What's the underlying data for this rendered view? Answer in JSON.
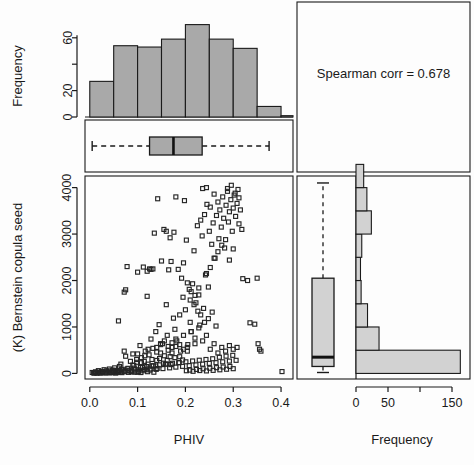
{
  "figure": {
    "annotation": "Spearman corr =  0.678",
    "xlabel_left": "PHIV",
    "xlabel_right": "Frequency",
    "ylabel_left": "(K) Bernstein copula seed",
    "ylabel_top": "Frequency",
    "colors": {
      "top_hist_fill": "#a9a9a9",
      "right_hist_fill": "#d2d2d2",
      "box_fill_top": "#a9a9a9",
      "box_fill_right": "#d2d2d2",
      "stroke": "#1a1a1a",
      "background": "#fdfdfd"
    }
  },
  "chart_data": [
    {
      "type": "bar",
      "name": "top-marginal-histogram",
      "title": "",
      "xlabel": "",
      "ylabel": "Frequency",
      "orientation": "vertical",
      "xlim": [
        -0.01,
        0.425
      ],
      "ylim": [
        0,
        75
      ],
      "ytick_values": [
        0,
        20,
        60
      ],
      "ytick_labels": [
        "0",
        "20",
        "60"
      ],
      "yminor_values": [
        40
      ],
      "bin_edges": [
        0.0,
        0.05,
        0.1,
        0.15,
        0.2,
        0.25,
        0.3,
        0.35,
        0.4
      ],
      "bin_width": 0.05,
      "categories": [
        "0.00-0.05",
        "0.05-0.10",
        "0.10-0.15",
        "0.15-0.20",
        "0.20-0.25",
        "0.25-0.30",
        "0.30-0.35",
        "0.35-0.40"
      ],
      "values": [
        27,
        54,
        53,
        59,
        70,
        59,
        52,
        8
      ],
      "extra_tail_value": 1,
      "grid": false,
      "legend": null
    },
    {
      "type": "boxplot",
      "name": "top-marginal-boxplot",
      "orientation": "horizontal",
      "variable": "PHIV",
      "xlim": [
        -0.01,
        0.425
      ],
      "whisker_low": 0.005,
      "q1": 0.125,
      "median": 0.175,
      "q3": 0.235,
      "whisker_high": 0.375,
      "outliers": []
    },
    {
      "type": "scatter",
      "name": "main-scatter",
      "title": "",
      "xlabel": "PHIV",
      "ylabel": "(K) Bernstein copula seed",
      "xlim": [
        -0.01,
        0.425
      ],
      "ylim": [
        -120,
        4250
      ],
      "xtick_values": [
        0.0,
        0.1,
        0.2,
        0.3,
        0.4
      ],
      "xtick_labels": [
        "0.0",
        "0.1",
        "0.2",
        "0.3",
        "0.4"
      ],
      "ytick_values": [
        0,
        1000,
        2000,
        3000,
        4000
      ],
      "ytick_labels": [
        "0",
        "1000",
        "2000",
        "3000",
        "4000"
      ],
      "marker": "open-square",
      "marker_size": 4,
      "spearman_corr": 0.678,
      "n_points": 383,
      "grid": false,
      "points": [
        [
          0.005,
          20
        ],
        [
          0.008,
          10
        ],
        [
          0.012,
          35
        ],
        [
          0.015,
          5
        ],
        [
          0.018,
          60
        ],
        [
          0.021,
          15
        ],
        [
          0.024,
          45
        ],
        [
          0.027,
          25
        ],
        [
          0.03,
          80
        ],
        [
          0.032,
          10
        ],
        [
          0.035,
          55
        ],
        [
          0.038,
          30
        ],
        [
          0.041,
          95
        ],
        [
          0.044,
          20
        ],
        [
          0.047,
          70
        ],
        [
          0.05,
          40
        ],
        [
          0.052,
          120
        ],
        [
          0.055,
          15
        ],
        [
          0.058,
          65
        ],
        [
          0.06,
          35
        ],
        [
          0.062,
          150
        ],
        [
          0.065,
          25
        ],
        [
          0.068,
          90
        ],
        [
          0.07,
          50
        ],
        [
          0.072,
          1750
        ],
        [
          0.075,
          1800
        ],
        [
          0.078,
          2300
        ],
        [
          0.06,
          1130
        ],
        [
          0.065,
          200
        ],
        [
          0.072,
          480
        ],
        [
          0.075,
          370
        ],
        [
          0.08,
          110
        ],
        [
          0.082,
          60
        ],
        [
          0.085,
          260
        ],
        [
          0.088,
          30
        ],
        [
          0.09,
          420
        ],
        [
          0.092,
          170
        ],
        [
          0.095,
          75
        ],
        [
          0.098,
          300
        ],
        [
          0.1,
          2180
        ],
        [
          0.102,
          45
        ],
        [
          0.105,
          600
        ],
        [
          0.108,
          230
        ],
        [
          0.11,
          130
        ],
        [
          0.112,
          2290
        ],
        [
          0.115,
          380
        ],
        [
          0.118,
          90
        ],
        [
          0.12,
          1660
        ],
        [
          0.122,
          520
        ],
        [
          0.125,
          2250
        ],
        [
          0.128,
          740
        ],
        [
          0.13,
          160
        ],
        [
          0.132,
          2250
        ],
        [
          0.135,
          3020
        ],
        [
          0.138,
          900
        ],
        [
          0.14,
          280
        ],
        [
          0.142,
          3760
        ],
        [
          0.145,
          1050
        ],
        [
          0.148,
          440
        ],
        [
          0.15,
          2420
        ],
        [
          0.152,
          640
        ],
        [
          0.155,
          3100
        ],
        [
          0.158,
          200
        ],
        [
          0.16,
          1480
        ],
        [
          0.162,
          820
        ],
        [
          0.165,
          2230
        ],
        [
          0.168,
          360
        ],
        [
          0.17,
          2410
        ],
        [
          0.172,
          560
        ],
        [
          0.175,
          1190
        ],
        [
          0.178,
          950
        ],
        [
          0.18,
          3800
        ],
        [
          0.182,
          700
        ],
        [
          0.185,
          2240
        ],
        [
          0.188,
          1260
        ],
        [
          0.19,
          480
        ],
        [
          0.192,
          2050
        ],
        [
          0.195,
          1640
        ],
        [
          0.198,
          3720
        ],
        [
          0.2,
          1370
        ],
        [
          0.202,
          2870
        ],
        [
          0.205,
          620
        ],
        [
          0.208,
          1810
        ],
        [
          0.21,
          1100
        ],
        [
          0.212,
          900
        ],
        [
          0.215,
          1930
        ],
        [
          0.218,
          2640
        ],
        [
          0.22,
          760
        ],
        [
          0.222,
          1520
        ],
        [
          0.225,
          3180
        ],
        [
          0.228,
          1690
        ],
        [
          0.23,
          1040
        ],
        [
          0.232,
          3300
        ],
        [
          0.235,
          2960
        ],
        [
          0.238,
          1400
        ],
        [
          0.24,
          3420
        ],
        [
          0.242,
          2120
        ],
        [
          0.245,
          3640
        ],
        [
          0.248,
          1860
        ],
        [
          0.25,
          3060
        ],
        [
          0.252,
          3580
        ],
        [
          0.255,
          2780
        ],
        [
          0.258,
          3240
        ],
        [
          0.26,
          3860
        ],
        [
          0.262,
          2480
        ],
        [
          0.265,
          3400
        ],
        [
          0.268,
          3690
        ],
        [
          0.27,
          2900
        ],
        [
          0.272,
          3520
        ],
        [
          0.275,
          3150
        ],
        [
          0.278,
          3800
        ],
        [
          0.28,
          3340
        ],
        [
          0.282,
          2700
        ],
        [
          0.285,
          3620
        ],
        [
          0.288,
          3920
        ],
        [
          0.29,
          3260
        ],
        [
          0.292,
          3480
        ],
        [
          0.295,
          3740
        ],
        [
          0.298,
          3060
        ],
        [
          0.3,
          3560
        ],
        [
          0.302,
          3840
        ],
        [
          0.305,
          3380
        ],
        [
          0.308,
          3660
        ],
        [
          0.31,
          3960
        ],
        [
          0.312,
          3220
        ],
        [
          0.315,
          3520
        ],
        [
          0.318,
          3100
        ],
        [
          0.32,
          2040
        ],
        [
          0.33,
          2000
        ],
        [
          0.335,
          1090
        ],
        [
          0.345,
          1060
        ],
        [
          0.35,
          2050
        ],
        [
          0.352,
          640
        ],
        [
          0.355,
          520
        ],
        [
          0.358,
          480
        ],
        [
          0.402,
          40
        ],
        [
          0.01,
          8
        ],
        [
          0.016,
          22
        ],
        [
          0.022,
          6
        ],
        [
          0.028,
          38
        ],
        [
          0.034,
          14
        ],
        [
          0.04,
          52
        ],
        [
          0.046,
          18
        ],
        [
          0.053,
          66
        ],
        [
          0.059,
          28
        ],
        [
          0.066,
          82
        ],
        [
          0.073,
          36
        ],
        [
          0.079,
          98
        ],
        [
          0.086,
          44
        ],
        [
          0.093,
          114
        ],
        [
          0.099,
          24
        ],
        [
          0.106,
          132
        ],
        [
          0.113,
          58
        ],
        [
          0.119,
          148
        ],
        [
          0.126,
          72
        ],
        [
          0.133,
          166
        ],
        [
          0.139,
          88
        ],
        [
          0.146,
          184
        ],
        [
          0.153,
          104
        ],
        [
          0.16,
          202
        ],
        [
          0.167,
          120
        ],
        [
          0.173,
          218
        ],
        [
          0.18,
          136
        ],
        [
          0.187,
          234
        ],
        [
          0.194,
          152
        ],
        [
          0.201,
          250
        ],
        [
          0.208,
          168
        ],
        [
          0.215,
          268
        ],
        [
          0.222,
          184
        ],
        [
          0.229,
          284
        ],
        [
          0.236,
          200
        ],
        [
          0.243,
          300
        ],
        [
          0.25,
          216
        ],
        [
          0.257,
          316
        ],
        [
          0.264,
          232
        ],
        [
          0.271,
          348
        ],
        [
          0.278,
          250
        ],
        [
          0.285,
          372
        ],
        [
          0.292,
          266
        ],
        [
          0.299,
          390
        ],
        [
          0.306,
          282
        ],
        [
          0.14,
          560
        ],
        [
          0.148,
          640
        ],
        [
          0.156,
          700
        ],
        [
          0.164,
          580
        ],
        [
          0.172,
          660
        ],
        [
          0.18,
          740
        ],
        [
          0.188,
          620
        ],
        [
          0.196,
          820
        ],
        [
          0.204,
          560
        ],
        [
          0.212,
          900
        ],
        [
          0.22,
          640
        ],
        [
          0.228,
          980
        ],
        [
          0.236,
          700
        ],
        [
          0.244,
          820
        ],
        [
          0.1,
          420
        ],
        [
          0.108,
          340
        ],
        [
          0.116,
          480
        ],
        [
          0.124,
          400
        ],
        [
          0.132,
          540
        ],
        [
          0.14,
          460
        ],
        [
          0.148,
          620
        ],
        [
          0.156,
          380
        ],
        [
          0.164,
          500
        ],
        [
          0.172,
          440
        ],
        [
          0.18,
          580
        ],
        [
          0.188,
          360
        ],
        [
          0.196,
          520
        ],
        [
          0.204,
          480
        ],
        [
          0.09,
          180
        ],
        [
          0.098,
          240
        ],
        [
          0.106,
          140
        ],
        [
          0.114,
          260
        ],
        [
          0.122,
          200
        ],
        [
          0.13,
          300
        ],
        [
          0.138,
          160
        ],
        [
          0.146,
          320
        ],
        [
          0.154,
          220
        ],
        [
          0.162,
          280
        ],
        [
          0.17,
          190
        ],
        [
          0.178,
          340
        ],
        [
          0.186,
          230
        ],
        [
          0.194,
          290
        ],
        [
          0.042,
          12
        ],
        [
          0.048,
          28
        ],
        [
          0.054,
          9
        ],
        [
          0.061,
          42
        ],
        [
          0.067,
          17
        ],
        [
          0.074,
          55
        ],
        [
          0.081,
          23
        ],
        [
          0.087,
          68
        ],
        [
          0.094,
          31
        ],
        [
          0.101,
          78
        ],
        [
          0.107,
          19
        ],
        [
          0.114,
          88
        ],
        [
          0.121,
          37
        ],
        [
          0.128,
          96
        ],
        [
          0.134,
          26
        ],
        [
          0.141,
          108
        ],
        [
          0.202,
          58
        ],
        [
          0.209,
          72
        ],
        [
          0.216,
          46
        ],
        [
          0.223,
          86
        ],
        [
          0.23,
          62
        ],
        [
          0.237,
          100
        ],
        [
          0.244,
          54
        ],
        [
          0.251,
          112
        ],
        [
          0.258,
          66
        ],
        [
          0.265,
          124
        ],
        [
          0.272,
          78
        ],
        [
          0.279,
          138
        ],
        [
          0.286,
          90
        ],
        [
          0.293,
          150
        ],
        [
          0.3,
          102
        ],
        [
          0.252,
          520
        ],
        [
          0.26,
          640
        ],
        [
          0.268,
          440
        ],
        [
          0.276,
          560
        ],
        [
          0.284,
          480
        ],
        [
          0.292,
          600
        ],
        [
          0.3,
          520
        ],
        [
          0.308,
          560
        ],
        [
          0.232,
          1260
        ],
        [
          0.24,
          1100
        ],
        [
          0.248,
          1180
        ],
        [
          0.256,
          1320
        ],
        [
          0.264,
          1020
        ],
        [
          0.212,
          1760
        ],
        [
          0.22,
          1680
        ],
        [
          0.228,
          1840
        ],
        [
          0.244,
          2150
        ],
        [
          0.252,
          2280
        ],
        [
          0.26,
          2480
        ],
        [
          0.268,
          2620
        ],
        [
          0.276,
          2760
        ],
        [
          0.284,
          2880
        ],
        [
          0.292,
          2440
        ],
        [
          0.3,
          2680
        ],
        [
          0.236,
          3980
        ],
        [
          0.244,
          4000
        ],
        [
          0.288,
          3980
        ],
        [
          0.296,
          4050
        ],
        [
          0.304,
          3880
        ],
        [
          0.312,
          3780
        ],
        [
          0.16,
          3060
        ],
        [
          0.168,
          2920
        ],
        [
          0.176,
          3040
        ],
        [
          0.12,
          2200
        ],
        [
          0.128,
          2240
        ],
        [
          0.196,
          2380
        ],
        [
          0.204,
          1950
        ],
        [
          0.21,
          1580
        ],
        [
          0.218,
          1480
        ],
        [
          0.226,
          1340
        ]
      ]
    },
    {
      "type": "bar",
      "name": "right-marginal-histogram",
      "title": "",
      "xlabel": "Frequency",
      "ylabel": "",
      "orientation": "horizontal",
      "xlim": [
        0,
        175
      ],
      "ylim": [
        -120,
        4250
      ],
      "xtick_values": [
        0,
        50,
        100,
        150
      ],
      "xtick_labels": [
        "0",
        "50",
        "",
        "150"
      ],
      "bin_edges": [
        0,
        500,
        1000,
        1500,
        2000,
        2500,
        3000,
        3500,
        4000
      ],
      "bin_width": 500,
      "categories": [
        "0-500",
        "500-1000",
        "1000-1500",
        "1500-2000",
        "2000-2500",
        "2500-3000",
        "3000-3500",
        "3500-4000",
        "4000-4500"
      ],
      "values": [
        163,
        36,
        18,
        8,
        7,
        9,
        24,
        17,
        12
      ],
      "grid": false
    },
    {
      "type": "boxplot",
      "name": "right-marginal-boxplot",
      "orientation": "vertical",
      "variable": "(K) Bernstein copula seed",
      "ylim": [
        -120,
        4250
      ],
      "whisker_low": 20,
      "q1": 150,
      "median": 350,
      "q3": 2050,
      "whisker_high": 4100,
      "outliers": []
    }
  ]
}
